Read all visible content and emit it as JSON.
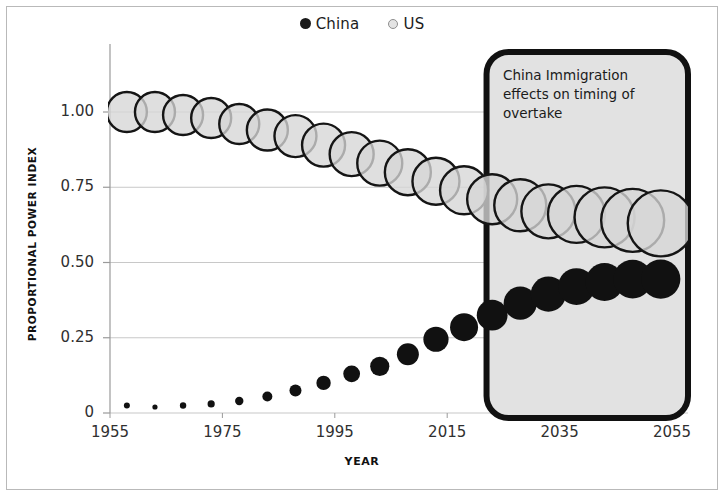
{
  "legend": {
    "position": "top-center",
    "entries": [
      {
        "label": "China",
        "marker": "filled-circle-dark",
        "color": "#1a1a1a"
      },
      {
        "label": "US",
        "marker": "open-circle-light",
        "color": "#e3e3e3"
      }
    ]
  },
  "annotation": {
    "text": "China Immigration effects on timing of overtake",
    "lines": [
      "China Immigration",
      "effects on timing of",
      "overtake"
    ],
    "box": {
      "x_start_year": 2022,
      "x_end_year": 2055,
      "fill": "#e2e2e2",
      "border": "#111111"
    }
  },
  "colors": {
    "china_fill": "#111111",
    "us_fill": "#d6d6d6",
    "us_stroke": "#151515",
    "gridline": "#c8c8c8",
    "axis": "#9a9a9a",
    "frame": "#b9b9b9",
    "text": "#1c1c1c"
  },
  "chart_data": {
    "type": "scatter",
    "title": "",
    "subtitle": "",
    "xlabel": "YEAR",
    "ylabel": "PROPORTIONAL POWER INDEX",
    "xlim": [
      1955,
      2058
    ],
    "ylim": [
      0,
      1.08
    ],
    "xticks": [
      1955,
      1975,
      1995,
      2015,
      2035,
      2055
    ],
    "xtick_labels": [
      "1955",
      "1975",
      "1995",
      "2015",
      "2035",
      "2055"
    ],
    "yticks": [
      0,
      0.25,
      0.5,
      0.75,
      1.0
    ],
    "ytick_labels": [
      "0",
      "0.25",
      "0.50",
      "0.75",
      "1.00"
    ],
    "grid": true,
    "grid_axis": "y",
    "legend_position": "top-center",
    "bubble_size_encoding": "marker radius grows with time for both series",
    "series": [
      {
        "name": "US",
        "marker": "open-circle-light",
        "x": [
          1958,
          1963,
          1968,
          1973,
          1978,
          1983,
          1988,
          1993,
          1998,
          2003,
          2008,
          2013,
          2018,
          2023,
          2028,
          2033,
          2038,
          2043,
          2048,
          2053
        ],
        "y": [
          1.0,
          1.0,
          0.99,
          0.98,
          0.96,
          0.94,
          0.92,
          0.89,
          0.86,
          0.83,
          0.8,
          0.77,
          0.74,
          0.71,
          0.69,
          0.67,
          0.66,
          0.65,
          0.64,
          0.63
        ],
        "r": [
          20,
          20,
          20,
          20,
          20,
          20.5,
          21,
          21.5,
          22,
          22.5,
          23,
          23.5,
          24,
          25,
          26,
          27,
          28.5,
          30,
          31.5,
          33
        ]
      },
      {
        "name": "China",
        "marker": "filled-circle-dark",
        "x": [
          1958,
          1963,
          1968,
          1973,
          1978,
          1983,
          1988,
          1993,
          1998,
          2003,
          2008,
          2013,
          2018,
          2023,
          2028,
          2033,
          2038,
          2043,
          2048,
          2053
        ],
        "y": [
          0.025,
          0.02,
          0.025,
          0.03,
          0.04,
          0.055,
          0.075,
          0.1,
          0.13,
          0.155,
          0.195,
          0.245,
          0.285,
          0.325,
          0.365,
          0.395,
          0.42,
          0.435,
          0.445,
          0.445
        ],
        "r": [
          3.0,
          2.6,
          3.2,
          3.6,
          4.2,
          5.0,
          6.0,
          7.2,
          8.4,
          9.6,
          11.0,
          12.6,
          14.0,
          15.4,
          16.6,
          17.6,
          18.4,
          19.0,
          19.4,
          19.6
        ]
      }
    ],
    "notes": [
      "Both series rendered as growing bubbles over time.",
      "US index declines from 1.00 toward ~0.63; China rises from ~0.02 toward ~0.45.",
      "Shaded rounded-rectangle callout covers approximately 2022-2055."
    ]
  }
}
